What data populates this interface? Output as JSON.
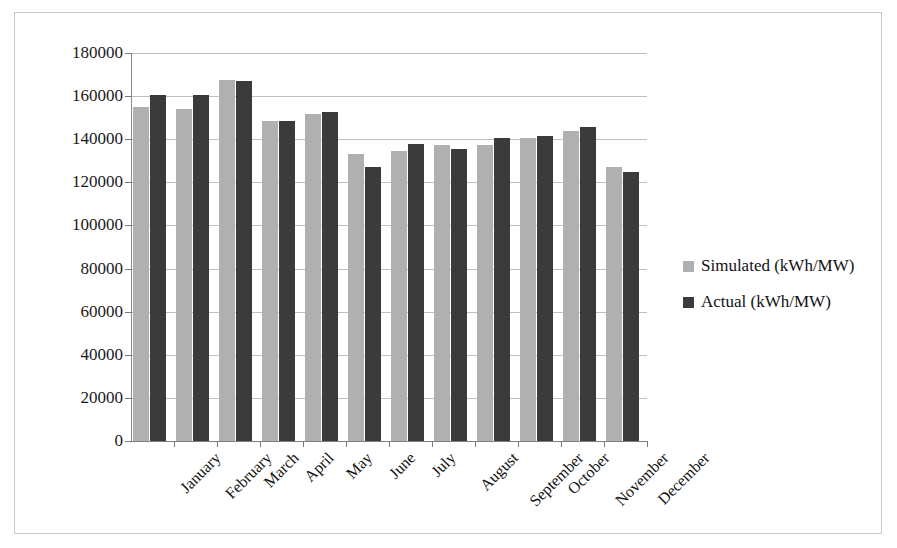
{
  "chart_data": {
    "type": "bar",
    "title": "",
    "xlabel": "",
    "ylabel": "",
    "ylim": [
      0,
      180000
    ],
    "ytick_step": 20000,
    "grid": true,
    "legend_position": "right",
    "categories": [
      "January",
      "February",
      "March",
      "April",
      "May",
      "June",
      "July",
      "August",
      "September",
      "October",
      "November",
      "December"
    ],
    "ytick_labels": [
      "180000",
      "160000",
      "140000",
      "120000",
      "100000",
      "80000",
      "60000",
      "40000",
      "20000",
      "0"
    ],
    "series": [
      {
        "name": "Simulated (kWh/MW)",
        "color": "#b0b0b0",
        "values": [
          155000,
          154000,
          167500,
          148500,
          151500,
          133000,
          134500,
          137500,
          137500,
          140500,
          144000,
          127000
        ]
      },
      {
        "name": "Actual (kWh/MW)",
        "color": "#3b3b3b",
        "values": [
          160500,
          160500,
          167000,
          148500,
          152500,
          127000,
          138000,
          135500,
          140500,
          141500,
          145500,
          125000
        ]
      }
    ]
  },
  "legend": {
    "items": [
      {
        "label": "Simulated (kWh/MW)",
        "swatch": "simulated"
      },
      {
        "label": "Actual (kWh/MW)",
        "swatch": "actual"
      }
    ]
  },
  "colors": {
    "simulated": "#b0b0b0",
    "actual": "#3b3b3b",
    "gridline": "#bfbfbf",
    "axis": "#8a8a8a",
    "border": "#c9c9c9",
    "text": "#111111",
    "background": "#ffffff"
  }
}
